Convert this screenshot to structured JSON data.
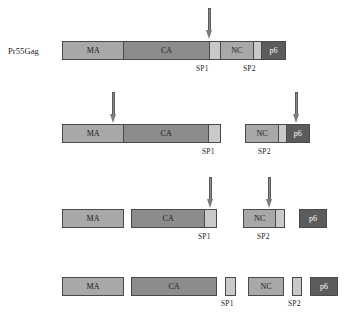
{
  "figure": {
    "row_label": "Pr55Gag"
  },
  "colors": {
    "ma": "#a8a8a8",
    "ca": "#8c8c8c",
    "sp": "#c9c9c9",
    "nc": "#a8a8a8",
    "p6": "#5c5c5c",
    "outline": "#4a4a4a",
    "arrow": "#8d8d8d",
    "background": "#ffffff",
    "text": "#1b1b1b"
  },
  "domains": {
    "ma": "MA",
    "ca": "CA",
    "sp1": "SP1",
    "nc": "NC",
    "sp2": "SP2",
    "p6": "p6"
  },
  "stages": [
    {
      "id": "stage-1",
      "label": "Pr55Gag",
      "fragments": [
        {
          "id": "fragment-full-precursor",
          "domains": [
            "MA",
            "CA",
            "SP1",
            "NC",
            "SP2",
            "p6"
          ]
        }
      ],
      "arrows": [
        {
          "id": "arrow-sp1-nc-cleavage",
          "target": "SP1/NC junction"
        }
      ],
      "captions": [
        "SP1",
        "SP2"
      ]
    },
    {
      "id": "stage-2",
      "label": "",
      "fragments": [
        {
          "id": "fragment-ma-ca-sp1",
          "domains": [
            "MA",
            "CA",
            "SP1"
          ]
        },
        {
          "id": "fragment-nc-sp2-p6",
          "domains": [
            "NC",
            "SP2",
            "p6"
          ]
        }
      ],
      "arrows": [
        {
          "id": "arrow-ma-ca-cleavage",
          "target": "MA/CA junction"
        },
        {
          "id": "arrow-sp2-p6-cleavage",
          "target": "SP2/p6 junction"
        }
      ],
      "captions": [
        "SP1",
        "SP2"
      ]
    },
    {
      "id": "stage-3",
      "label": "",
      "fragments": [
        {
          "id": "fragment-ma",
          "domains": [
            "MA"
          ]
        },
        {
          "id": "fragment-ca-sp1",
          "domains": [
            "CA",
            "SP1"
          ]
        },
        {
          "id": "fragment-nc-sp2",
          "domains": [
            "NC",
            "SP2"
          ]
        },
        {
          "id": "fragment-p6",
          "domains": [
            "p6"
          ]
        }
      ],
      "arrows": [
        {
          "id": "arrow-ca-sp1-cleavage",
          "target": "CA/SP1 junction"
        },
        {
          "id": "arrow-nc-sp2-cleavage",
          "target": "NC/SP2 junction"
        }
      ],
      "captions": [
        "SP1",
        "SP2"
      ]
    },
    {
      "id": "stage-4",
      "label": "",
      "fragments": [
        {
          "id": "fragment-ma-final",
          "domains": [
            "MA"
          ]
        },
        {
          "id": "fragment-ca-final",
          "domains": [
            "CA"
          ]
        },
        {
          "id": "fragment-sp1-final",
          "domains": [
            "SP1"
          ]
        },
        {
          "id": "fragment-nc-final",
          "domains": [
            "NC"
          ]
        },
        {
          "id": "fragment-sp2-final",
          "domains": [
            "SP2"
          ]
        },
        {
          "id": "fragment-p6-final",
          "domains": [
            "p6"
          ]
        }
      ],
      "arrows": [],
      "captions": [
        "SP1",
        "SP2"
      ]
    }
  ]
}
